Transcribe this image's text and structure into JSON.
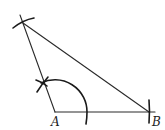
{
  "diagram": {
    "type": "compass-and-straightedge construction",
    "points": {
      "A": {
        "label": "A",
        "x": 55,
        "y": 112
      },
      "B": {
        "label": "B",
        "x": 148,
        "y": 112
      },
      "C": {
        "label": "",
        "x": 23,
        "y": 23
      }
    },
    "labels": {
      "a": "A",
      "b": "B"
    },
    "colors": {
      "stroke": "#2a2a2a",
      "background": "#ffffff"
    }
  }
}
